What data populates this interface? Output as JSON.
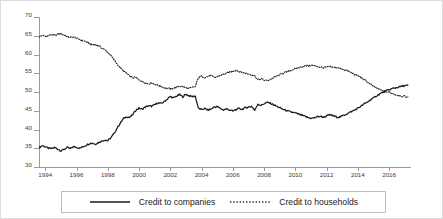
{
  "chart_data": {
    "type": "line",
    "title": "",
    "subtitle": "",
    "xlabel": "",
    "ylabel": "",
    "xlim": [
      1993.6,
      2017.4
    ],
    "ylim": [
      30,
      70
    ],
    "grid": false,
    "legend_position": "bottom",
    "yticks": [
      70,
      65,
      60,
      55,
      50,
      45,
      40,
      35,
      30
    ],
    "xticks": [
      1994,
      1996,
      1998,
      2000,
      2002,
      2004,
      2006,
      2008,
      2010,
      2012,
      2014,
      2016
    ],
    "series": [
      {
        "name": "Credit to companies",
        "style": "solid",
        "color": "#1a1a1a",
        "x": [
          1993.6,
          1993.8,
          1994.0,
          1994.2,
          1994.4,
          1994.6,
          1994.8,
          1995.0,
          1995.2,
          1995.4,
          1995.6,
          1995.8,
          1996.0,
          1996.2,
          1996.4,
          1996.6,
          1996.8,
          1997.0,
          1997.2,
          1997.4,
          1997.6,
          1997.8,
          1998.0,
          1998.2,
          1998.4,
          1998.6,
          1998.8,
          1999.0,
          1999.2,
          1999.4,
          1999.6,
          1999.8,
          2000.0,
          2000.2,
          2000.4,
          2000.6,
          2000.8,
          2001.0,
          2001.2,
          2001.4,
          2001.6,
          2001.8,
          2002.0,
          2002.2,
          2002.4,
          2002.6,
          2002.8,
          2003.0,
          2003.2,
          2003.4,
          2003.6,
          2003.8,
          2004.0,
          2004.2,
          2004.4,
          2004.6,
          2004.8,
          2005.0,
          2005.2,
          2005.4,
          2005.6,
          2005.8,
          2006.0,
          2006.2,
          2006.4,
          2006.6,
          2006.8,
          2007.0,
          2007.2,
          2007.4,
          2007.6,
          2007.8,
          2008.0,
          2008.2,
          2008.4,
          2008.6,
          2008.8,
          2009.0,
          2009.2,
          2009.4,
          2009.6,
          2009.8,
          2010.0,
          2010.2,
          2010.4,
          2010.6,
          2010.8,
          2011.0,
          2011.2,
          2011.4,
          2011.6,
          2011.8,
          2012.0,
          2012.2,
          2012.4,
          2012.6,
          2012.8,
          2013.0,
          2013.2,
          2013.4,
          2013.6,
          2013.8,
          2014.0,
          2014.2,
          2014.4,
          2014.6,
          2014.8,
          2015.0,
          2015.2,
          2015.4,
          2015.6,
          2015.8,
          2016.0,
          2016.2,
          2016.4,
          2016.6,
          2016.8,
          2017.0,
          2017.2
        ],
        "y": [
          35.2,
          35.7,
          35.4,
          35.0,
          34.9,
          35.2,
          34.8,
          34.3,
          34.7,
          35.2,
          34.9,
          35.4,
          35.3,
          35.0,
          35.4,
          35.8,
          36.2,
          36.4,
          36.1,
          36.5,
          36.9,
          37.2,
          37.0,
          37.8,
          38.9,
          40.4,
          41.7,
          42.9,
          43.4,
          43.2,
          44.0,
          45.2,
          45.7,
          45.4,
          46.0,
          46.3,
          46.2,
          46.6,
          47.1,
          46.9,
          47.4,
          48.1,
          48.8,
          48.4,
          48.9,
          49.3,
          48.7,
          49.4,
          49.0,
          48.8,
          48.9,
          45.6,
          45.3,
          45.6,
          45.2,
          45.4,
          46.0,
          46.1,
          45.6,
          45.2,
          45.5,
          45.2,
          44.9,
          45.3,
          45.6,
          45.4,
          45.8,
          46.0,
          46.2,
          45.1,
          46.8,
          46.4,
          46.9,
          47.2,
          47.0,
          46.6,
          46.2,
          45.8,
          45.4,
          45.1,
          44.8,
          44.6,
          44.4,
          44.1,
          43.8,
          43.5,
          43.2,
          43.0,
          43.1,
          43.4,
          43.5,
          43.3,
          43.6,
          43.9,
          43.7,
          43.4,
          43.3,
          43.6,
          44.0,
          44.4,
          44.8,
          45.2,
          45.7,
          46.2,
          46.8,
          47.3,
          47.9,
          48.4,
          49.0,
          49.5,
          49.9,
          50.3,
          50.6,
          50.9,
          51.1,
          51.3,
          51.5,
          51.7,
          51.8
        ]
      },
      {
        "name": "Credit to households",
        "style": "dotted",
        "color": "#2b2b2b",
        "x": [
          1993.6,
          1993.8,
          1994.0,
          1994.2,
          1994.4,
          1994.6,
          1994.8,
          1995.0,
          1995.2,
          1995.4,
          1995.6,
          1995.8,
          1996.0,
          1996.2,
          1996.4,
          1996.6,
          1996.8,
          1997.0,
          1997.2,
          1997.4,
          1997.6,
          1997.8,
          1998.0,
          1998.2,
          1998.4,
          1998.6,
          1998.8,
          1999.0,
          1999.2,
          1999.4,
          1999.6,
          1999.8,
          2000.0,
          2000.2,
          2000.4,
          2000.6,
          2000.8,
          2001.0,
          2001.2,
          2001.4,
          2001.6,
          2001.8,
          2002.0,
          2002.2,
          2002.4,
          2002.6,
          2002.8,
          2003.0,
          2003.2,
          2003.4,
          2003.6,
          2003.8,
          2004.0,
          2004.2,
          2004.4,
          2004.6,
          2004.8,
          2005.0,
          2005.2,
          2005.4,
          2005.6,
          2005.8,
          2006.0,
          2006.2,
          2006.4,
          2006.6,
          2006.8,
          2007.0,
          2007.2,
          2007.4,
          2007.6,
          2007.8,
          2008.0,
          2008.2,
          2008.4,
          2008.6,
          2008.8,
          2009.0,
          2009.2,
          2009.4,
          2009.6,
          2009.8,
          2010.0,
          2010.2,
          2010.4,
          2010.6,
          2010.8,
          2011.0,
          2011.2,
          2011.4,
          2011.6,
          2011.8,
          2012.0,
          2012.2,
          2012.4,
          2012.6,
          2012.8,
          2013.0,
          2013.2,
          2013.4,
          2013.6,
          2013.8,
          2014.0,
          2014.2,
          2014.4,
          2014.6,
          2014.8,
          2015.0,
          2015.2,
          2015.4,
          2015.6,
          2015.8,
          2016.0,
          2016.2,
          2016.4,
          2016.6,
          2016.8,
          2017.0,
          2017.2
        ],
        "y": [
          64.6,
          65.1,
          64.8,
          65.0,
          65.3,
          65.1,
          65.4,
          65.5,
          65.2,
          64.8,
          64.5,
          64.7,
          64.3,
          64.0,
          63.7,
          63.4,
          63.0,
          62.5,
          62.7,
          62.3,
          61.8,
          61.3,
          60.6,
          59.7,
          58.6,
          57.5,
          56.4,
          55.6,
          55.0,
          54.2,
          53.8,
          53.9,
          53.3,
          52.8,
          52.5,
          52.2,
          52.4,
          52.1,
          51.8,
          51.5,
          51.2,
          51.0,
          50.8,
          51.0,
          51.3,
          51.6,
          51.4,
          51.1,
          50.9,
          51.2,
          51.4,
          53.9,
          54.2,
          53.9,
          54.1,
          54.4,
          53.8,
          54.1,
          54.4,
          54.7,
          55.0,
          55.3,
          55.6,
          55.8,
          55.5,
          55.2,
          55.0,
          54.8,
          54.6,
          54.3,
          53.3,
          53.5,
          53.2,
          53.0,
          53.4,
          53.8,
          54.2,
          54.6,
          55.0,
          55.3,
          55.6,
          55.9,
          56.2,
          56.5,
          56.7,
          56.9,
          57.0,
          57.1,
          57.0,
          56.8,
          56.6,
          56.5,
          56.6,
          56.7,
          56.6,
          56.5,
          56.3,
          56.1,
          55.8,
          55.5,
          55.1,
          54.7,
          54.3,
          53.8,
          53.3,
          52.7,
          52.1,
          51.5,
          51.0,
          50.6,
          50.3,
          50.1,
          49.9,
          49.6,
          49.3,
          49.1,
          48.9,
          48.8,
          48.7
        ]
      }
    ]
  }
}
